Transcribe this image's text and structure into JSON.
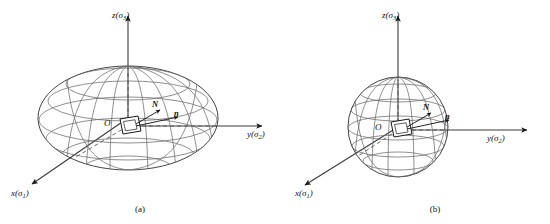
{
  "figure": {
    "caption_a": "(a)",
    "caption_b": "(b)",
    "panels": [
      {
        "id": "panel-a",
        "shape": "ellipsoid",
        "caption": "(a)",
        "axes": [
          {
            "name": "z-axis",
            "label_main": "z",
            "label_paren_open": "(",
            "label_sigma": "σ",
            "label_index": "3",
            "label_paren_close": ")",
            "full": "z(σ3)",
            "direction": "up"
          },
          {
            "name": "y-axis",
            "label_main": "y",
            "label_paren_open": "(",
            "label_sigma": "σ",
            "label_index": "2",
            "label_paren_close": ")",
            "full": "y(σ2)",
            "direction": "right"
          },
          {
            "name": "x-axis",
            "label_main": "x",
            "label_paren_open": "(",
            "label_sigma": "σ",
            "label_index": "1",
            "label_paren_close": ")",
            "full": "x(σ1)",
            "direction": "lower-left"
          }
        ],
        "origin_label": "O",
        "vector_labels": [
          {
            "name": "normal-N",
            "label": "N"
          },
          {
            "name": "normal-n",
            "label": "n"
          }
        ]
      },
      {
        "id": "panel-b",
        "shape": "sphere",
        "caption": "(b)",
        "axes": [
          {
            "name": "z-axis",
            "label_main": "z",
            "label_paren_open": "(",
            "label_sigma": "σ",
            "label_index": "3",
            "label_paren_close": ")",
            "full": "z(σ3)",
            "direction": "up"
          },
          {
            "name": "y-axis",
            "label_main": "y",
            "label_paren_open": "(",
            "label_sigma": "σ",
            "label_index": "2",
            "label_paren_close": ")",
            "full": "y(σ2)",
            "direction": "right"
          },
          {
            "name": "x-axis",
            "label_main": "x",
            "label_paren_open": "(",
            "label_sigma": "σ",
            "label_index": "1",
            "label_paren_close": ")",
            "full": "x(σ1)",
            "direction": "lower-left"
          }
        ],
        "origin_label": "O",
        "vector_labels": [
          {
            "name": "normal-N",
            "label": "N"
          },
          {
            "name": "normal-n",
            "label": "n"
          }
        ]
      }
    ],
    "colors": {
      "background": "#ffffff",
      "stroke": "#3a3a3a",
      "stroke_dark": "#1a1a1a",
      "text": "#111111"
    }
  }
}
